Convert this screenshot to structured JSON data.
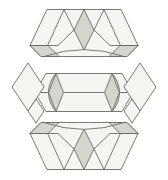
{
  "figure": {
    "kind": "geometric-dissection-diagram",
    "description_visible_text": "",
    "canvas": {
      "width": 168,
      "height": 180,
      "background": "#ffffff"
    },
    "palette": {
      "piece_fill": "#f5f5f1",
      "shaded_fill": "#d5d5cf",
      "stroke": "#6a6a66",
      "stroke_width": 0.9
    },
    "pieces": [
      {
        "name": "top-strip",
        "shapes": [
          {
            "name": "top-strip-outline",
            "fill": "piece",
            "d": "M30,45.5 L47,9.5 L121,9.5 L138,45.5 L127,56.5 L41,56.5 Z"
          },
          {
            "name": "top-strip-shaded-center-diamond",
            "fill": "shaded",
            "d": "M84,9.5 L94,30 L84,50 L74,30 Z"
          },
          {
            "name": "top-strip-shaded-left-rhombus",
            "fill": "shaded",
            "d": "M30,45.5 L48,45.5 L59,56.5 L41,56.5 Z"
          },
          {
            "name": "top-strip-shaded-right-rhombus",
            "fill": "shaded",
            "d": "M138,45.5 L120,45.5 L109,56.5 L127,56.5 Z"
          },
          {
            "name": "top-strip-tiling-lines",
            "fill": "none",
            "d": "M64,9.5 L47.5,45.5 M30,45.5 L58,45.5 M64,9.5 L74,30 M74,30 L58,45.5 M104,9.5 L120.5,45.5 M110,45.5 L138,45.5 M104,9.5 L94,30 M94,30 L110,45.5"
          },
          {
            "name": "top-strip-circle-arc",
            "fill": "none",
            "d": "M44,56.5 A123,123 0 0 1 124,56.5"
          }
        ]
      },
      {
        "name": "middle-strip",
        "shapes": [
          {
            "name": "middle-strip-outline",
            "fill": "piece",
            "d": "M35,92.5 L46,73.5 L122,73.5 L133,92.5 L122,111.5 L46,111.5 Z"
          },
          {
            "name": "middle-strip-shaded-left-lens",
            "fill": "shaded",
            "d": "M56,73.5 L63.5,92.5 L56,111.5 A28,28 0 0 1 56,73.5 Z"
          },
          {
            "name": "middle-strip-shaded-right-lens",
            "fill": "shaded",
            "d": "M112,73.5 L104.5,92.5 L112,111.5 A28,28 0 0 0 112,73.5 Z"
          },
          {
            "name": "middle-strip-lens-straight-edges",
            "fill": "none",
            "d": "M56,73.5 L48.5,92.5 L56,111.5 M112,73.5 L119.5,92.5 L112,111.5"
          },
          {
            "name": "middle-strip-horizontal-lines",
            "fill": "none",
            "d": "M63.5,92.5 L104.5,92.5 M35,92.5 L48.5,92.5 M119.5,92.5 L133,92.5"
          }
        ]
      },
      {
        "name": "bottom-strip",
        "shapes": [
          {
            "name": "bottom-strip-outline",
            "fill": "piece",
            "d": "M30,133.5 L41,122.5 L127,122.5 L138,133.5 L121,169.5 L47,169.5 Z"
          },
          {
            "name": "bottom-strip-shaded-center-diamond",
            "fill": "shaded",
            "d": "M84,129 L94,149 L84,169.5 L74,149 Z"
          },
          {
            "name": "bottom-strip-shaded-left-rhombus",
            "fill": "shaded",
            "d": "M30,133.5 L48,133.5 L59,122.5 L41,122.5 Z"
          },
          {
            "name": "bottom-strip-shaded-right-rhombus",
            "fill": "shaded",
            "d": "M138,133.5 L120,133.5 L109,122.5 L127,122.5 Z"
          },
          {
            "name": "bottom-strip-tiling-lines",
            "fill": "none",
            "d": "M64,169.5 L47.5,133.5 M30,133.5 L58,133.5 M64,169.5 L74,149 M74,149 L58,133.5 M104,169.5 L120.5,133.5 M110,133.5 L138,133.5 M104,169.5 L94,149 M94,149 L110,133.5"
          },
          {
            "name": "bottom-strip-circle-arc",
            "fill": "none",
            "d": "M44,122.5 A123,123 0 0 0 124,122.5"
          }
        ]
      },
      {
        "name": "left-corner-piece",
        "shapes": [
          {
            "name": "left-piece-large-rhombus",
            "fill": "piece",
            "d": "M28,63 L44,87 L28,111 L12,87 Z"
          },
          {
            "name": "left-piece-small-rhombus",
            "fill": "piece",
            "d": "M36,99 L44,111 L36,123 L28,111 Z"
          }
        ]
      },
      {
        "name": "right-corner-piece",
        "shapes": [
          {
            "name": "right-piece-large-rhombus",
            "fill": "piece",
            "d": "M140,63 L156,87 L140,111 L124,87 Z"
          },
          {
            "name": "right-piece-small-rhombus",
            "fill": "piece",
            "d": "M132,99 L124,111 L132,123 L140,111 Z"
          }
        ]
      }
    ]
  }
}
